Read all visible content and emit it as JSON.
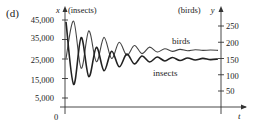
{
  "panel": "(d)",
  "chart_data": {
    "type": "line",
    "title": "",
    "xlabel": "t",
    "ylabel_left": "x (insects)",
    "ylabel_right": "(birds) y",
    "left_axis": {
      "label_var": "x",
      "label_unit": "(insects)",
      "ticks": [
        "45,000",
        "35,000",
        "25,000",
        "15,000",
        "5,000"
      ],
      "tick_values": [
        45000,
        35000,
        25000,
        15000,
        5000
      ],
      "origin_label": "0"
    },
    "right_axis": {
      "label_var": "y",
      "label_unit": "(birds)",
      "ticks": [
        "250",
        "200",
        "150",
        "100",
        "50"
      ],
      "tick_values": [
        250,
        200,
        150,
        100,
        50
      ]
    },
    "series": [
      {
        "name": "insects",
        "axis": "left",
        "description": "damped oscillation starting near 45,000, converging to about 25,000",
        "t": [
          0,
          0.5,
          1,
          1.5,
          2,
          2.5,
          3,
          3.5,
          4,
          4.5,
          5,
          5.5,
          6,
          6.5,
          7,
          7.5,
          8,
          8.5,
          9,
          9.5,
          10
        ],
        "values": [
          44000,
          12000,
          36000,
          16000,
          31000,
          19000,
          29000,
          21000,
          27500,
          22500,
          26500,
          23500,
          26000,
          24000,
          25800,
          24200,
          25500,
          24500,
          25300,
          24700,
          25000
        ]
      },
      {
        "name": "birds",
        "axis": "right",
        "description": "damped oscillation starting near 260, converging to about 175",
        "t": [
          0,
          0.5,
          1,
          1.5,
          2,
          2.5,
          3,
          3.5,
          4,
          4.5,
          5,
          5.5,
          6,
          6.5,
          7,
          7.5,
          8,
          8.5,
          9,
          9.5,
          10
        ],
        "values": [
          150,
          265,
          120,
          235,
          140,
          215,
          150,
          200,
          160,
          190,
          165,
          185,
          170,
          180,
          172,
          178,
          174,
          177,
          175,
          176,
          175
        ]
      }
    ],
    "legend": "inline labels",
    "grid": false
  }
}
